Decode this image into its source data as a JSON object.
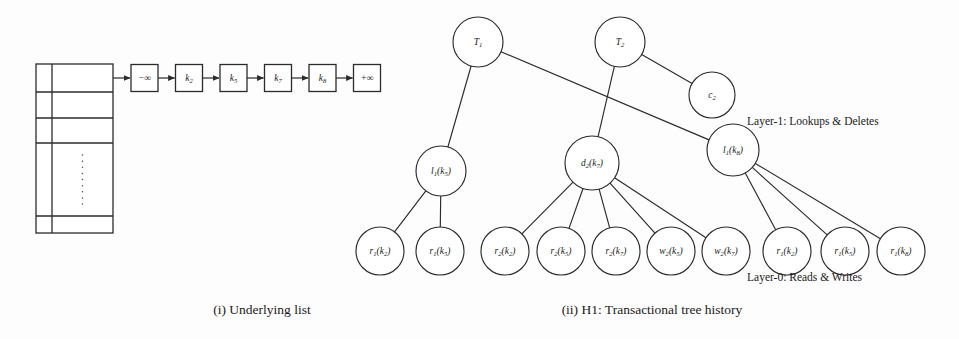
{
  "figure": {
    "width": 959,
    "height": 339,
    "background": "#fdfdfd",
    "ink_color": "#2b2b2b"
  },
  "captions": {
    "left": "(i) Underlying list",
    "right": "(ii) H1: Transactional tree history"
  },
  "layer_labels": {
    "layer1": "Layer-1: Lookups & Deletes",
    "layer0": "Layer-0: Reads & Writes"
  },
  "list_panel": {
    "table": {
      "rows": 5,
      "columns": 2,
      "ellipsis": "⋮",
      "ellipsis_row_index": 3
    },
    "nodes": [
      {
        "id": "box-neg-inf",
        "base": "−∞",
        "sub": ""
      },
      {
        "id": "box-k2",
        "base": "k",
        "sub": "2"
      },
      {
        "id": "box-k5",
        "base": "k",
        "sub": "5"
      },
      {
        "id": "box-k7",
        "base": "k",
        "sub": "7"
      },
      {
        "id": "box-k8",
        "base": "k",
        "sub": "8"
      },
      {
        "id": "box-pos-inf",
        "base": "+∞",
        "sub": ""
      }
    ]
  },
  "tree": {
    "root_nodes": [
      {
        "id": "T1",
        "base": "T",
        "sub": "1",
        "x": 478,
        "y": 42,
        "r": 25
      },
      {
        "id": "T2",
        "base": "T",
        "sub": "2",
        "x": 620,
        "y": 42,
        "r": 25
      }
    ],
    "commit_nodes": [
      {
        "id": "c2",
        "base": "c",
        "sub": "2",
        "x": 712,
        "y": 95,
        "r": 23
      }
    ],
    "layer1_nodes": [
      {
        "id": "l1k5",
        "base": "l",
        "sub": "1",
        "arg_base": "k",
        "arg_sub": "5",
        "x": 441,
        "y": 171,
        "r": 25
      },
      {
        "id": "d2k7",
        "base": "d",
        "sub": "2",
        "arg_base": "k",
        "arg_sub": "7",
        "x": 592,
        "y": 163,
        "r": 27
      },
      {
        "id": "l1k8",
        "base": "l",
        "sub": "1",
        "arg_base": "k",
        "arg_sub": "8",
        "x": 733,
        "y": 150,
        "r": 26
      }
    ],
    "layer0_nodes": [
      {
        "id": "r1k2-a",
        "base": "r",
        "sub": "1",
        "arg_base": "k",
        "arg_sub": "2",
        "x": 380,
        "y": 251,
        "r": 24
      },
      {
        "id": "r1k5-a",
        "base": "r",
        "sub": "1",
        "arg_base": "k",
        "arg_sub": "5",
        "x": 440,
        "y": 251,
        "r": 24
      },
      {
        "id": "r2k2",
        "base": "r",
        "sub": "2",
        "arg_base": "k",
        "arg_sub": "2",
        "x": 505,
        "y": 251,
        "r": 24
      },
      {
        "id": "r2k5",
        "base": "r",
        "sub": "2",
        "arg_base": "k",
        "arg_sub": "5",
        "x": 561,
        "y": 251,
        "r": 24
      },
      {
        "id": "r2k7",
        "base": "r",
        "sub": "2",
        "arg_base": "k",
        "arg_sub": "7",
        "x": 616,
        "y": 251,
        "r": 24
      },
      {
        "id": "w2k5",
        "base": "w",
        "sub": "2",
        "arg_base": "k",
        "arg_sub": "5",
        "x": 671,
        "y": 251,
        "r": 24
      },
      {
        "id": "w2k7",
        "base": "w",
        "sub": "2",
        "arg_base": "k",
        "arg_sub": "7",
        "x": 726,
        "y": 251,
        "r": 24
      },
      {
        "id": "r1k2-b",
        "base": "r",
        "sub": "1",
        "arg_base": "k",
        "arg_sub": "2",
        "x": 787,
        "y": 251,
        "r": 24
      },
      {
        "id": "r1k5-b",
        "base": "r",
        "sub": "1",
        "arg_base": "k",
        "arg_sub": "5",
        "x": 845,
        "y": 251,
        "r": 24
      },
      {
        "id": "r1k8",
        "base": "r",
        "sub": "1",
        "arg_base": "k",
        "arg_sub": "8",
        "x": 901,
        "y": 251,
        "r": 24
      }
    ],
    "edges": [
      {
        "from": "T1",
        "to": "l1k5"
      },
      {
        "from": "T1",
        "to": "l1k8"
      },
      {
        "from": "T2",
        "to": "d2k7"
      },
      {
        "from": "T2",
        "to": "c2"
      },
      {
        "from": "l1k5",
        "to": "r1k2-a"
      },
      {
        "from": "l1k5",
        "to": "r1k5-a"
      },
      {
        "from": "d2k7",
        "to": "r2k2"
      },
      {
        "from": "d2k7",
        "to": "r2k5"
      },
      {
        "from": "d2k7",
        "to": "r2k7"
      },
      {
        "from": "d2k7",
        "to": "w2k5"
      },
      {
        "from": "d2k7",
        "to": "w2k7"
      },
      {
        "from": "l1k8",
        "to": "r1k2-b"
      },
      {
        "from": "l1k8",
        "to": "r1k5-b"
      },
      {
        "from": "l1k8",
        "to": "r1k8"
      }
    ]
  }
}
